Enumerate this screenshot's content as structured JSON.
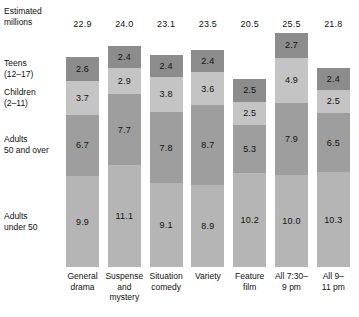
{
  "header": {
    "axis_title_line1": "Estimated",
    "axis_title_line2": "millions"
  },
  "legend": [
    {
      "line1": "Teens",
      "line2": "(12–17)"
    },
    {
      "line1": "Children",
      "line2": "(2–11)"
    },
    {
      "line1": "Adults",
      "line2": "50 and over"
    },
    {
      "line1": "Adults",
      "line2": "under 50"
    }
  ],
  "chart_data": {
    "type": "bar",
    "subtype": "stacked-bar",
    "title": "",
    "xlabel": "",
    "ylabel": "Estimated millions",
    "grid": false,
    "legend_position": "left-inline",
    "ylim": [
      0,
      25.5
    ],
    "categories": [
      [
        "General",
        "drama"
      ],
      [
        "Suspense",
        "and",
        "mystery"
      ],
      [
        "Situation",
        "comedy"
      ],
      [
        "Variety"
      ],
      [
        "Feature",
        "film"
      ],
      [
        "All 7:30–",
        "9 pm"
      ],
      [
        "All 9–",
        "11 pm"
      ]
    ],
    "category_labels": [
      "General drama",
      "Suspense and mystery",
      "Situation comedy",
      "Variety",
      "Feature film",
      "All 7:30–9 pm",
      "All 9–11 pm"
    ],
    "totals": [
      "22.9",
      "24.0",
      "23.1",
      "23.5",
      "20.5",
      "25.5",
      "21.8"
    ],
    "totals_numeric": [
      22.9,
      24.0,
      23.1,
      23.5,
      20.5,
      25.5,
      21.8
    ],
    "series": [
      {
        "name": "Teens (12-17)",
        "color": "#8c8c8c",
        "values": [
          2.6,
          2.4,
          2.4,
          2.4,
          2.5,
          2.7,
          2.4
        ],
        "labels": [
          "2.6",
          "2.4",
          "2.4",
          "2.4",
          "2.5",
          "2.7",
          "2.4"
        ]
      },
      {
        "name": "Children (2-11)",
        "color": "#c4c4c4",
        "values": [
          3.7,
          2.9,
          3.8,
          3.6,
          2.5,
          4.9,
          2.5
        ],
        "labels": [
          "3.7",
          "2.9",
          "3.8",
          "3.6",
          "2.5",
          "4.9",
          "2.5"
        ]
      },
      {
        "name": "Adults 50 and over",
        "color": "#9e9e9e",
        "values": [
          6.7,
          7.7,
          7.8,
          8.7,
          5.3,
          7.9,
          6.5
        ],
        "labels": [
          "6.7",
          "7.7",
          "7.8",
          "8.7",
          "5.3",
          "7.9",
          "6.5"
        ]
      },
      {
        "name": "Adults under 50",
        "color": "#b5b5b5",
        "values": [
          9.9,
          11.1,
          9.1,
          8.9,
          10.2,
          10.0,
          10.3
        ],
        "labels": [
          "9.9",
          "11.1",
          "9.1",
          "8.9",
          "10.2",
          "10.0",
          "10.3"
        ]
      }
    ]
  },
  "colors": {
    "teens": "#8c8c8c",
    "children": "#c4c4c4",
    "adults_50_over": "#9e9e9e",
    "adults_under_50": "#b5b5b5",
    "text": "#111111",
    "background": "#ffffff"
  }
}
